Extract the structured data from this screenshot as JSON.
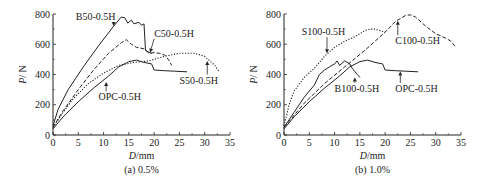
{
  "chart_data": [
    {
      "type": "line",
      "panel": "left",
      "caption": "(a) 0.5%",
      "xlabel_italic": "D",
      "xlabel_unit": "/mm",
      "ylabel_italic": "P",
      "ylabel_unit": "/ N",
      "xlim": [
        0,
        35
      ],
      "ylim": [
        0,
        800
      ],
      "xticks": [
        0,
        5,
        10,
        15,
        20,
        25,
        30,
        35
      ],
      "yticks": [
        0,
        200,
        400,
        600,
        800
      ],
      "grid": false,
      "series": [
        {
          "name": "B50-0.5H",
          "style": "solid",
          "points": [
            [
              0,
              60
            ],
            [
              1,
              170
            ],
            [
              3,
              300
            ],
            [
              6,
              450
            ],
            [
              9,
              590
            ],
            [
              12,
              720
            ],
            [
              13.5,
              780
            ],
            [
              14.2,
              775
            ],
            [
              14.8,
              740
            ],
            [
              15.5,
              760
            ],
            [
              16,
              735
            ],
            [
              17,
              745
            ],
            [
              17.5,
              725
            ],
            [
              18,
              735
            ],
            [
              18.3,
              560
            ],
            [
              18.8,
              550
            ],
            [
              19.5,
              540
            ]
          ]
        },
        {
          "name": "C50-0.5H",
          "style": "dashed",
          "points": [
            [
              0,
              50
            ],
            [
              2,
              160
            ],
            [
              5,
              300
            ],
            [
              8,
              430
            ],
            [
              11,
              540
            ],
            [
              13.5,
              610
            ],
            [
              14.5,
              630
            ],
            [
              15.5,
              600
            ],
            [
              16.5,
              580
            ],
            [
              18,
              570
            ],
            [
              19,
              540
            ],
            [
              20,
              545
            ],
            [
              21,
              540
            ],
            [
              22,
              530
            ],
            [
              22.8,
              500
            ],
            [
              23.5,
              460
            ]
          ]
        },
        {
          "name": "S50-0.5H",
          "style": "dotted",
          "points": [
            [
              0,
              50
            ],
            [
              2,
              150
            ],
            [
              4,
              240
            ],
            [
              7,
              340
            ],
            [
              10,
              410
            ],
            [
              13,
              460
            ],
            [
              16,
              480
            ],
            [
              19,
              490
            ],
            [
              22,
              520
            ],
            [
              25,
              540
            ],
            [
              28,
              540
            ],
            [
              30,
              520
            ],
            [
              31,
              490
            ],
            [
              32,
              460
            ],
            [
              32.8,
              420
            ]
          ]
        },
        {
          "name": "OPC-0.5H",
          "style": "solid",
          "points": [
            [
              0,
              40
            ],
            [
              2,
              120
            ],
            [
              5,
              220
            ],
            [
              8,
              310
            ],
            [
              11,
              390
            ],
            [
              13,
              450
            ],
            [
              15,
              485
            ],
            [
              16.5,
              495
            ],
            [
              18,
              480
            ],
            [
              19.5,
              470
            ],
            [
              20,
              430
            ],
            [
              22,
              425
            ],
            [
              24,
              422
            ],
            [
              26.5,
              418
            ]
          ]
        }
      ],
      "annotations": [
        {
          "text": "B50-0.5H",
          "x": 4.5,
          "y": 760,
          "arrow_to": [
            12,
            720
          ]
        },
        {
          "text": "C50-0.5H",
          "x": 20,
          "y": 650,
          "arrow_to": [
            19.2,
            545
          ]
        },
        {
          "text": "S50-0.5H",
          "x": 25,
          "y": 340,
          "arrow_to": [
            30.5,
            490
          ]
        },
        {
          "text": "OPC-0.5H",
          "x": 9,
          "y": 230,
          "arrow_to": [
            10.5,
            350
          ]
        }
      ]
    },
    {
      "type": "line",
      "panel": "right",
      "caption": "(b) 1.0%",
      "xlabel_italic": "D",
      "xlabel_unit": "/mm",
      "ylabel_italic": "P",
      "ylabel_unit": "/ N",
      "xlim": [
        0,
        35
      ],
      "ylim": [
        0,
        800
      ],
      "xticks": [
        0,
        5,
        10,
        15,
        20,
        25,
        30,
        35
      ],
      "yticks": [
        0,
        200,
        400,
        600,
        800
      ],
      "grid": false,
      "series": [
        {
          "name": "S100-0.5H",
          "style": "dotted",
          "points": [
            [
              0,
              60
            ],
            [
              1,
              200
            ],
            [
              2,
              290
            ],
            [
              4,
              380
            ],
            [
              6,
              440
            ],
            [
              8,
              520
            ],
            [
              10,
              580
            ],
            [
              12,
              620
            ],
            [
              14,
              650
            ],
            [
              16,
              690
            ],
            [
              17,
              700
            ],
            [
              18,
              700
            ],
            [
              19,
              690
            ],
            [
              20,
              680
            ]
          ]
        },
        {
          "name": "C100-0.5H",
          "style": "dashed",
          "points": [
            [
              0,
              50
            ],
            [
              4,
              210
            ],
            [
              8,
              340
            ],
            [
              12,
              450
            ],
            [
              16,
              560
            ],
            [
              20,
              680
            ],
            [
              22,
              750
            ],
            [
              24,
              790
            ],
            [
              25,
              795
            ],
            [
              26,
              780
            ],
            [
              28,
              720
            ],
            [
              30,
              670
            ],
            [
              32,
              640
            ],
            [
              33,
              620
            ],
            [
              34,
              580
            ]
          ]
        },
        {
          "name": "B100-0.5H",
          "style": "solid",
          "points": [
            [
              0,
              50
            ],
            [
              2,
              150
            ],
            [
              4,
              250
            ],
            [
              6,
              330
            ],
            [
              7,
              400
            ],
            [
              8,
              430
            ],
            [
              9,
              450
            ],
            [
              10,
              470
            ],
            [
              10.5,
              490
            ],
            [
              11,
              460
            ],
            [
              12,
              490
            ],
            [
              13,
              470
            ],
            [
              13.5,
              440
            ],
            [
              14,
              420
            ],
            [
              14.5,
              400
            ],
            [
              15,
              380
            ]
          ]
        },
        {
          "name": "OPC-0.5H",
          "style": "solid",
          "points": [
            [
              0,
              40
            ],
            [
              2,
              120
            ],
            [
              5,
              220
            ],
            [
              8,
              310
            ],
            [
              11,
              390
            ],
            [
              13,
              450
            ],
            [
              15,
              485
            ],
            [
              16.5,
              495
            ],
            [
              18,
              480
            ],
            [
              19.5,
              470
            ],
            [
              20,
              430
            ],
            [
              22,
              425
            ],
            [
              24,
              422
            ],
            [
              26.5,
              418
            ]
          ]
        }
      ],
      "annotations": [
        {
          "text": "S100-0.5H",
          "x": 3.5,
          "y": 660,
          "arrow_to": [
            8.5,
            540
          ]
        },
        {
          "text": "C100-0.5H",
          "x": 22,
          "y": 600,
          "arrow_to": [
            22.5,
            755
          ]
        },
        {
          "text": "B100-0.5H",
          "x": 10,
          "y": 285,
          "arrow_to": [
            14,
            380
          ]
        },
        {
          "text": "OPC-0.5H",
          "x": 22,
          "y": 285,
          "arrow_to": [
            23,
            420
          ]
        }
      ]
    }
  ],
  "panels": {
    "left": {
      "caption": "(a) 0.5%",
      "ylabel": "P/ N",
      "xlabel": "D/mm"
    },
    "right": {
      "caption": "(b) 1.0%",
      "ylabel": "P/ N",
      "xlabel": "D/mm"
    }
  }
}
